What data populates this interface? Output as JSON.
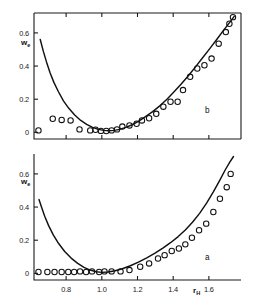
{
  "figure": {
    "panels": [
      {
        "id": "b",
        "letter": "b",
        "position": "top"
      },
      {
        "id": "a",
        "letter": "a",
        "position": "bottom"
      }
    ]
  },
  "chart_data": [
    {
      "type": "scatter",
      "panel": "b",
      "title": "",
      "xlabel": "",
      "ylabel": "w_e",
      "ylabel_base": "w",
      "ylabel_sub": "e",
      "xlim": [
        0.62,
        1.78
      ],
      "ylim": [
        -0.04,
        0.72
      ],
      "xticks": [
        0.8,
        1.0,
        1.2,
        1.4,
        1.6
      ],
      "xticklabels": [
        "",
        "",
        "",
        "",
        ""
      ],
      "yticks": [
        0,
        0.2,
        0.4,
        0.6
      ],
      "yticklabels": [
        "0",
        "0.2",
        "0.4",
        "0.6"
      ],
      "grid": false,
      "legend": false,
      "marker": "open-circle",
      "series": [
        {
          "name": "data",
          "x": [
            0.645,
            0.725,
            0.775,
            0.825,
            0.875,
            0.935,
            0.965,
            0.995,
            1.025,
            1.055,
            1.085,
            1.115,
            1.155,
            1.195,
            1.225,
            1.265,
            1.305,
            1.345,
            1.385,
            1.425,
            1.455,
            1.495,
            1.535,
            1.575,
            1.615,
            1.655,
            1.695,
            1.715,
            1.735
          ],
          "y": [
            0.012,
            0.082,
            0.075,
            0.072,
            0.018,
            0.012,
            0.016,
            0.009,
            0.008,
            0.012,
            0.018,
            0.035,
            0.042,
            0.052,
            0.072,
            0.085,
            0.112,
            0.155,
            0.185,
            0.185,
            0.255,
            0.335,
            0.385,
            0.405,
            0.445,
            0.535,
            0.605,
            0.655,
            0.695
          ]
        }
      ],
      "fit_curve": {
        "name": "model",
        "x": [
          0.655,
          0.672,
          0.69,
          0.71,
          0.732,
          0.757,
          0.785,
          0.815,
          0.848,
          0.882,
          0.915,
          0.948,
          0.98,
          1.01,
          1.04,
          1.07,
          1.1,
          1.135,
          1.17,
          1.205,
          1.245,
          1.285,
          1.325,
          1.365,
          1.405,
          1.445,
          1.485,
          1.525,
          1.565,
          1.605,
          1.645,
          1.685,
          1.72,
          1.742
        ],
        "y": [
          0.56,
          0.49,
          0.425,
          0.36,
          0.3,
          0.245,
          0.19,
          0.145,
          0.105,
          0.072,
          0.048,
          0.03,
          0.018,
          0.012,
          0.01,
          0.012,
          0.018,
          0.03,
          0.046,
          0.066,
          0.095,
          0.125,
          0.16,
          0.2,
          0.245,
          0.292,
          0.342,
          0.395,
          0.45,
          0.505,
          0.562,
          0.62,
          0.668,
          0.7
        ]
      }
    },
    {
      "type": "scatter",
      "panel": "a",
      "title": "",
      "xlabel": "r_H",
      "xlabel_base": "r",
      "xlabel_sub": "H",
      "ylabel": "w_e",
      "ylabel_base": "w",
      "ylabel_sub": "e",
      "xlim": [
        0.62,
        1.78
      ],
      "ylim": [
        -0.04,
        0.72
      ],
      "xticks": [
        0.8,
        1.0,
        1.2,
        1.4,
        1.6
      ],
      "xticklabels": [
        "0.8",
        "1.0",
        "1.2",
        "1.4",
        "1.6"
      ],
      "yticks": [
        0,
        0.2,
        0.4,
        0.6
      ],
      "yticklabels": [
        "0",
        "0.2",
        "0.4",
        "0.6"
      ],
      "grid": false,
      "legend": false,
      "marker": "open-circle",
      "series": [
        {
          "name": "data",
          "x": [
            0.645,
            0.695,
            0.735,
            0.775,
            0.812,
            0.845,
            0.878,
            0.912,
            0.945,
            0.985,
            1.015,
            1.055,
            1.105,
            1.155,
            1.215,
            1.265,
            1.315,
            1.352,
            1.392,
            1.432,
            1.468,
            1.505,
            1.545,
            1.585,
            1.625,
            1.662,
            1.7,
            1.722
          ],
          "y": [
            0.008,
            0.008,
            0.008,
            0.008,
            0.008,
            0.008,
            0.012,
            0.008,
            0.012,
            0.008,
            0.012,
            0.012,
            0.012,
            0.02,
            0.04,
            0.06,
            0.09,
            0.11,
            0.135,
            0.15,
            0.175,
            0.215,
            0.26,
            0.3,
            0.37,
            0.45,
            0.52,
            0.6
          ]
        }
      ],
      "fit_curve": {
        "name": "model",
        "x": [
          0.648,
          0.662,
          0.68,
          0.702,
          0.728,
          0.758,
          0.792,
          0.828,
          0.865,
          0.9,
          0.935,
          0.968,
          1.0,
          1.035,
          1.075,
          1.115,
          1.16,
          1.205,
          1.252,
          1.298,
          1.342,
          1.385,
          1.428,
          1.468,
          1.508,
          1.548,
          1.588,
          1.625,
          1.66,
          1.692,
          1.718,
          1.738
        ],
        "y": [
          0.445,
          0.4,
          0.345,
          0.288,
          0.232,
          0.18,
          0.132,
          0.092,
          0.06,
          0.036,
          0.02,
          0.01,
          0.006,
          0.008,
          0.016,
          0.028,
          0.046,
          0.068,
          0.094,
          0.122,
          0.152,
          0.185,
          0.222,
          0.262,
          0.308,
          0.362,
          0.425,
          0.492,
          0.56,
          0.625,
          0.672,
          0.705
        ]
      }
    }
  ]
}
